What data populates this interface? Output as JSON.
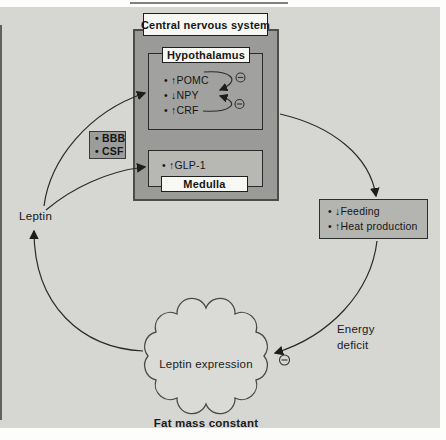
{
  "diagram": {
    "cns": {
      "label": "Central nervous system"
    },
    "hypothalamus": {
      "label": "Hypothalamus",
      "items": [
        {
          "text": "• ↑POMC"
        },
        {
          "text": "• ↓NPY"
        },
        {
          "text": "• ↑CRF"
        }
      ]
    },
    "medulla": {
      "label": "Medulla",
      "items": [
        {
          "text": "• ↑GLP-1"
        }
      ]
    },
    "barrier": {
      "items": [
        {
          "text": "• BBB"
        },
        {
          "text": "• CSF"
        }
      ]
    },
    "leptin": {
      "label": "Leptin"
    },
    "effects": {
      "items": [
        {
          "text": "• ↓Feeding"
        },
        {
          "text": "• ↑Heat production"
        }
      ]
    },
    "energy_deficit": {
      "line1": "Energy",
      "line2": "deficit"
    },
    "cloud": {
      "label": "Leptin expression"
    },
    "fat_mass": {
      "label": "Fat mass constant"
    },
    "icons": {
      "inhibition": "⊖"
    },
    "colors": {
      "background": "#d6d6d3",
      "cns_fill": "#9a9a98",
      "inner_fill": "#a1a19f",
      "light_fill": "#b7b7b4",
      "label_fill": "#f7f7f4",
      "line": "#2a2a2a"
    }
  }
}
